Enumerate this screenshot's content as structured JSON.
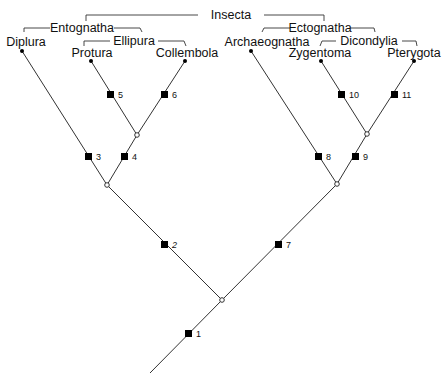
{
  "groups": {
    "insecta": "Insecta",
    "entognatha": "Entognatha",
    "ellipura": "Ellipura",
    "ectognatha": "Ectognatha",
    "dicondylia": "Dicondylia"
  },
  "taxa": {
    "diplura": "Diplura",
    "protura": "Protura",
    "collembola": "Collembola",
    "archaeognatha": "Archaeognatha",
    "zygentoma": "Zygentoma",
    "pterygota": "Pterygota"
  },
  "apomorphies": {
    "a1": "1",
    "a2": "2",
    "a3": "3",
    "a4": "4",
    "a5": "5",
    "a6": "6",
    "a7": "7",
    "a8": "8",
    "a9": "9",
    "a10": "10",
    "a11": "11"
  },
  "colors": {
    "line": "#333333",
    "text": "#111111",
    "marker": "#000000",
    "background": "#ffffff"
  }
}
